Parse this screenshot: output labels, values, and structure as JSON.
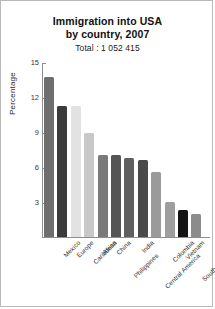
{
  "chart_data": {
    "type": "bar",
    "title": "Immigration into USA by country, 2007",
    "title_line1": "Immigration into USA",
    "title_line2": "by country, 2007",
    "subtitle": "Total : 1 052 415",
    "xlabel": "",
    "ylabel": "Percentage",
    "ylim": [
      0,
      15
    ],
    "yticks": [
      15,
      12,
      9,
      6,
      3
    ],
    "grid": false,
    "legend": "none",
    "categories": [
      "Mexico",
      "Europe",
      "Caribbean",
      "Africa",
      "China",
      "Philippines",
      "India",
      "Central America",
      "Colombia",
      "Vietnam",
      "South Korea"
    ],
    "values": [
      13.7,
      11.2,
      11.2,
      8.9,
      7.0,
      7.0,
      6.8,
      6.6,
      5.6,
      3.0,
      2.3
    ],
    "colors": [
      "#6e6e6e",
      "#3b3b3b",
      "#e2e2e2",
      "#c8c8c8",
      "#7a7a7a",
      "#555555",
      "#5f5f5f",
      "#4a4a4a",
      "#9a9a9a",
      "#9e9e9e",
      "#141414"
    ],
    "extra_bar": {
      "label": "",
      "value": 2.0,
      "color": "#8c8c8c"
    }
  },
  "axis": {
    "tick_color": "#8e8e8e"
  }
}
